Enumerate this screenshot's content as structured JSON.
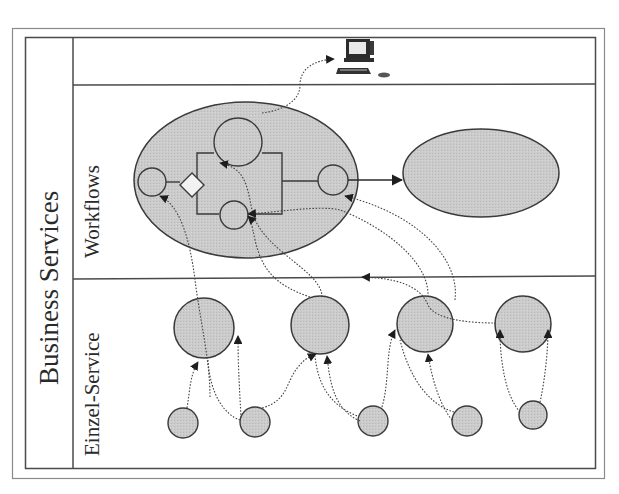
{
  "diagram": {
    "title": "Business Services",
    "lanes": [
      {
        "id": "workflows",
        "label": "Workflows"
      },
      {
        "id": "einzel-service",
        "label": "Einzel-Service"
      }
    ],
    "top_row": {
      "icon": "computer-workstation-icon"
    },
    "workflow_process": {
      "nodes": [
        "start-circle",
        "decision-diamond",
        "upper-branch-circle",
        "lower-branch-circle",
        "end-circle"
      ],
      "target": "second-workflow-ellipse"
    },
    "einzel_services": {
      "large_circles": 4,
      "small_circles": 5
    },
    "colors": {
      "fill": "#c8c8c8",
      "stroke": "#3a3a3a",
      "border": "#555555",
      "outer_border": "#8a8a8a",
      "background": "#ffffff"
    }
  }
}
